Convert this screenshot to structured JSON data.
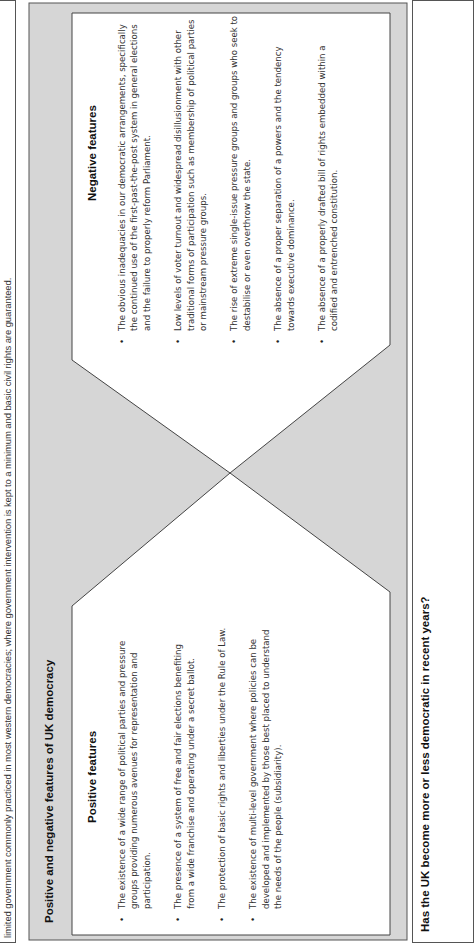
{
  "intro": {
    "text": "limited government commonly practiced in most western democracies; where government intervention is kept to a minimum and basic civil rights are guaranteed."
  },
  "feature_box": {
    "title": "Positive and negative features of UK democracy",
    "colors": {
      "box_fill": "#d6d6d6",
      "panel_fill": "#ffffff",
      "border": "#555555"
    },
    "positive": {
      "heading": "Positive features",
      "items": [
        "The existence of a wide range of political parties and pressure groups providing numerous avenues for representation and participation.",
        "The presence of a system of free and fair elections benefiting from a wide franchise and operating under a secret ballot.",
        "The protection of basic rights and liberties under the Rule of Law.",
        "The existence of multi-level government where policies can be developed and implemented by those best placed to understand the needs of the people (subsidiarity)."
      ]
    },
    "negative": {
      "heading": "Negative features",
      "items": [
        "The obvious inadequacies in our democratic arrangements, specifically the continued use of the first-past-the-post system in general elections and the failure to properly reform Parliament.",
        "Low levels of voter turnout and widespread disillusionment with other traditional forms of participation such as membership of political parties or mainstream pressure groups.",
        "The rise of extreme single-issue pressure groups and groups who seek to destabilise or even overthrow the state.",
        "The absence of a proper separation of a powers and the tendency towards executive dominance.",
        "The absence of a properly drafted bill of rights embedded within a codified and entrenched constitution."
      ]
    }
  },
  "next_section": {
    "title": "Has the UK become more or less democratic in recent years?"
  }
}
